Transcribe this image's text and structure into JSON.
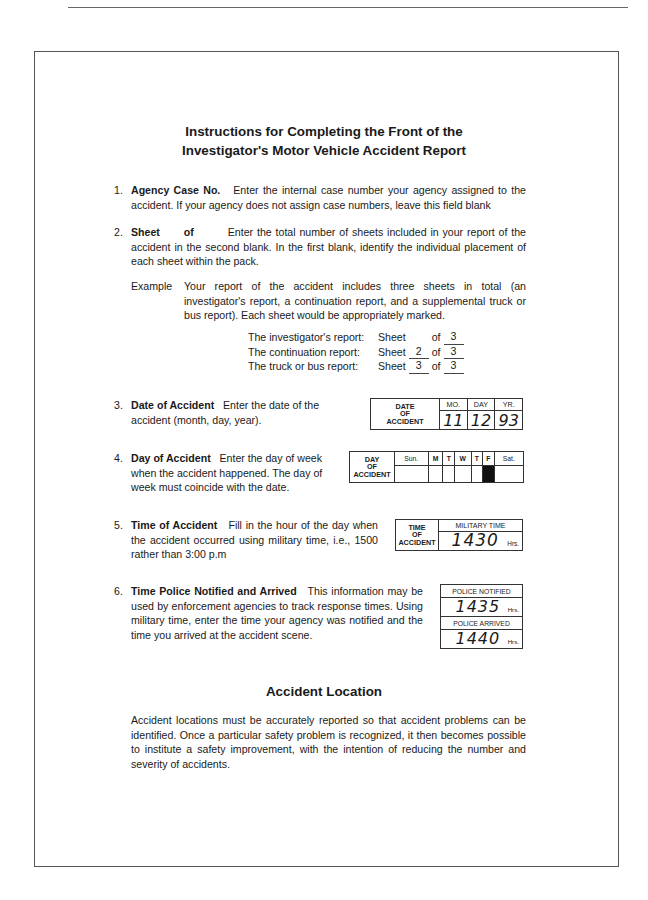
{
  "document": {
    "title_line1": "Instructions for Completing the Front of the",
    "title_line2": "Investigator's Motor Vehicle Accident Report"
  },
  "items": [
    {
      "number": "1.",
      "heading": "Agency Case No.",
      "text": "Enter the internal case number your agency assigned to the accident. If your agency does not assign case numbers, leave this field blank"
    },
    {
      "number": "2.",
      "heading": "Sheet",
      "heading_of": "of",
      "text": "Enter the total number of sheets included in your report of the accident in the second blank. In the first blank, identify the individual placement of each sheet within the pack."
    },
    {
      "number": "3.",
      "heading": "Date of Accident",
      "text": "Enter the date of the accident (month, day, year)."
    },
    {
      "number": "4.",
      "heading": "Day of Accident",
      "text": "Enter the day of week when the accident happened. The day of week must coincide with the date."
    },
    {
      "number": "5.",
      "heading": "Time of Accident",
      "text": "Fill in the hour of the day when the accident occurred using military time, i.e., 1500 rather than 3:00 p.m"
    },
    {
      "number": "6.",
      "heading": "Time Police Notified and Arrived",
      "text": "This information may be used by enforcement agencies to track response times. Using military time, enter the time your agency was notified and the time you arrived at the accident scene."
    }
  ],
  "example": {
    "label": "Example",
    "text": "Your report of the accident includes three sheets in total (an investigator's report, a continuation report, and a supplemental truck or bus report). Each sheet would be appropriately marked.",
    "rows": [
      {
        "label": "The investigator's report:",
        "sheet": "Sheet",
        "current": "",
        "of": "of",
        "total": "3"
      },
      {
        "label": "The continuation report:",
        "sheet": "Sheet",
        "current": "2",
        "of": "of",
        "total": "3"
      },
      {
        "label": "The truck or bus report:",
        "sheet": "Sheet",
        "current": "3",
        "of": "of",
        "total": "3"
      }
    ]
  },
  "date_box": {
    "label_line1": "DATE",
    "label_line2": "OF",
    "label_line3": "ACCIDENT",
    "col_mo": "MO.",
    "col_day": "DAY",
    "col_yr": "YR.",
    "mo": "11",
    "day": "12",
    "yr": "93"
  },
  "day_box": {
    "label_line1": "DAY",
    "label_line2": "OF",
    "label_line3": "ACCIDENT",
    "days": [
      "Sun.",
      "M",
      "T",
      "W",
      "T",
      "F",
      "Sat."
    ],
    "selected_index": 5
  },
  "time_box": {
    "label_line1": "TIME",
    "label_line2": "OF",
    "label_line3": "ACCIDENT",
    "header": "MILITARY TIME",
    "value": "1430",
    "unit": "Hrs."
  },
  "police_box": {
    "notified_label": "POLICE NOTIFIED",
    "notified_value": "1435",
    "arrived_label": "POLICE ARRIVED",
    "arrived_value": "1440",
    "unit": "Hrs."
  },
  "location": {
    "title": "Accident Location",
    "text": "Accident locations must be accurately reported so that accident problems can be identified. Once a particular safety problem is recognized, it then becomes possible to institute a safety improvement, with the intention of reducing the number and severity of accidents."
  }
}
